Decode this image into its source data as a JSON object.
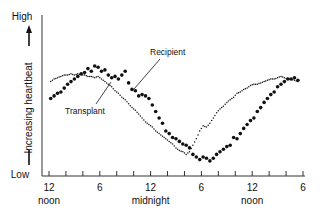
{
  "chart_data": {
    "type": "scatter",
    "title": "",
    "xlabel": "",
    "ylabel": "Increasing heartbeat",
    "y_axis_extremes": {
      "top": "High",
      "bottom": "Low"
    },
    "x_ticks": [
      {
        "hour": 0,
        "label": "12",
        "sublabel": "noon"
      },
      {
        "hour": 6,
        "label": "6",
        "sublabel": ""
      },
      {
        "hour": 12,
        "label": "12",
        "sublabel": "midnight"
      },
      {
        "hour": 18,
        "label": "6",
        "sublabel": ""
      },
      {
        "hour": 24,
        "label": "12",
        "sublabel": "noon"
      },
      {
        "hour": 30,
        "label": "6",
        "sublabel": ""
      }
    ],
    "minor_tick_every_hours": 2,
    "xlim": [
      -1,
      30.2
    ],
    "ylim": [
      0,
      100
    ],
    "grid": false,
    "legend": "inline-annotations",
    "annotations": [
      {
        "text": "Recipient",
        "series": "Recipient"
      },
      {
        "text": "Transplant",
        "series": "Transplant"
      }
    ],
    "series": [
      {
        "name": "Recipient",
        "marker": "large-dot",
        "x": [
          0.2,
          0.6,
          1.0,
          1.4,
          1.8,
          2.2,
          2.6,
          3.0,
          3.4,
          3.8,
          4.2,
          4.6,
          5.0,
          5.4,
          5.8,
          6.2,
          6.6,
          7.0,
          7.4,
          7.8,
          8.2,
          8.6,
          9.0,
          9.4,
          9.8,
          10.2,
          10.6,
          11.0,
          11.4,
          11.8,
          12.2,
          12.6,
          13.0,
          13.4,
          13.8,
          14.2,
          14.6,
          15.0,
          15.4,
          15.8,
          16.2,
          16.6,
          17.0,
          17.4,
          17.8,
          18.2,
          18.6,
          19.0,
          19.4,
          19.8,
          20.2,
          20.6,
          21.0,
          21.4,
          21.8,
          22.2,
          22.6,
          23.0,
          23.4,
          23.8,
          24.2,
          24.6,
          25.0,
          25.4,
          25.8,
          26.2,
          26.6,
          27.0,
          27.4,
          27.8,
          28.2,
          28.6,
          29.0,
          29.4
        ],
        "values": [
          55,
          57,
          59,
          60,
          63,
          66,
          68,
          70,
          72,
          74,
          75,
          78,
          76,
          80,
          79,
          76,
          77,
          73,
          71,
          72,
          70,
          73,
          76,
          67,
          62,
          61,
          57,
          58,
          57,
          55,
          50,
          45,
          40,
          36,
          30,
          28,
          25,
          24,
          22,
          20,
          19,
          17,
          12,
          10,
          8,
          10,
          9,
          7,
          9,
          12,
          14,
          16,
          18,
          19,
          25,
          24,
          28,
          32,
          35,
          38,
          40,
          45,
          48,
          52,
          55,
          58,
          60,
          64,
          66,
          68,
          70,
          70,
          71,
          69
        ],
        "color": "#111111"
      },
      {
        "name": "Transplant",
        "marker": "small-dot",
        "x": [
          0.2,
          0.6,
          1.0,
          1.4,
          1.8,
          2.2,
          2.6,
          3.0,
          3.4,
          3.8,
          4.2,
          4.6,
          5.0,
          5.4,
          5.8,
          6.2,
          6.6,
          7.0,
          7.4,
          7.8,
          8.2,
          8.6,
          9.0,
          9.4,
          9.8,
          10.2,
          10.6,
          11.0,
          11.4,
          11.8,
          12.2,
          12.6,
          13.0,
          13.4,
          13.8,
          14.2,
          14.6,
          15.0,
          15.4,
          15.8,
          16.2,
          16.6,
          17.0,
          17.4,
          17.8,
          18.2,
          18.6,
          19.0,
          19.4,
          19.8,
          20.2,
          20.6,
          21.0,
          21.4,
          21.8,
          22.2,
          22.6,
          23.0,
          23.4,
          23.8,
          24.2,
          24.6,
          25.0,
          25.4,
          25.8,
          26.2,
          26.6,
          27.0,
          27.4,
          27.8,
          28.2,
          28.6,
          29.0,
          29.4
        ],
        "values": [
          68,
          70,
          71,
          72,
          73,
          73,
          74,
          73,
          74,
          73,
          73,
          72,
          72,
          71,
          72,
          70,
          68,
          66,
          64,
          61,
          59,
          56,
          54,
          51,
          48,
          46,
          43,
          40,
          37,
          35,
          33,
          30,
          28,
          26,
          24,
          22,
          20,
          17,
          15,
          14,
          12,
          14,
          19,
          24,
          30,
          34,
          33,
          36,
          40,
          44,
          47,
          49,
          52,
          54,
          56,
          59,
          60,
          62,
          63,
          65,
          66,
          66,
          67,
          68,
          69,
          70,
          70,
          71,
          72,
          71,
          70,
          70,
          69,
          68
        ],
        "color": "#111111"
      }
    ]
  }
}
